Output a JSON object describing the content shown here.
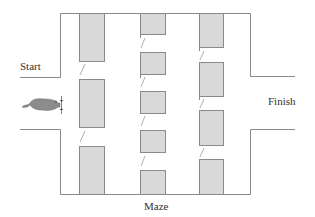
{
  "diagram": {
    "title": "Maze",
    "labels": {
      "start": "Start",
      "finish": "Finish",
      "caption": "Maze"
    },
    "colors": {
      "wall": "#8a8a8a",
      "box_fill": "#d9d9d9",
      "mouse": "#8c8c8c",
      "text": "#333333"
    },
    "elements": {
      "subject": "mouse-icon",
      "columns": [
        {
          "name": "column-1",
          "boxes": 3,
          "doors": 2
        },
        {
          "name": "column-2",
          "boxes": 5,
          "doors": 4
        },
        {
          "name": "column-3",
          "boxes": 4,
          "doors": 3
        }
      ]
    }
  }
}
